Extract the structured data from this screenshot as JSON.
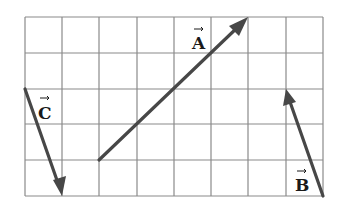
{
  "diagram": {
    "type": "vector-grid",
    "grid": {
      "columns": 8,
      "rows": 5,
      "line_color": "#8a8a8a"
    },
    "vector_color": "#474747",
    "vectors": [
      {
        "name": "A",
        "label": "A",
        "from_cell": [
          2,
          1
        ],
        "to_cell": [
          6,
          5
        ],
        "components": [
          4,
          4
        ]
      },
      {
        "name": "B",
        "label": "B",
        "from_cell": [
          8,
          0
        ],
        "to_cell": [
          7,
          3
        ],
        "components": [
          -1,
          3
        ]
      },
      {
        "name": "C",
        "label": "C",
        "from_cell": [
          0,
          3
        ],
        "to_cell": [
          1,
          0
        ],
        "components": [
          1,
          -3
        ]
      }
    ]
  }
}
